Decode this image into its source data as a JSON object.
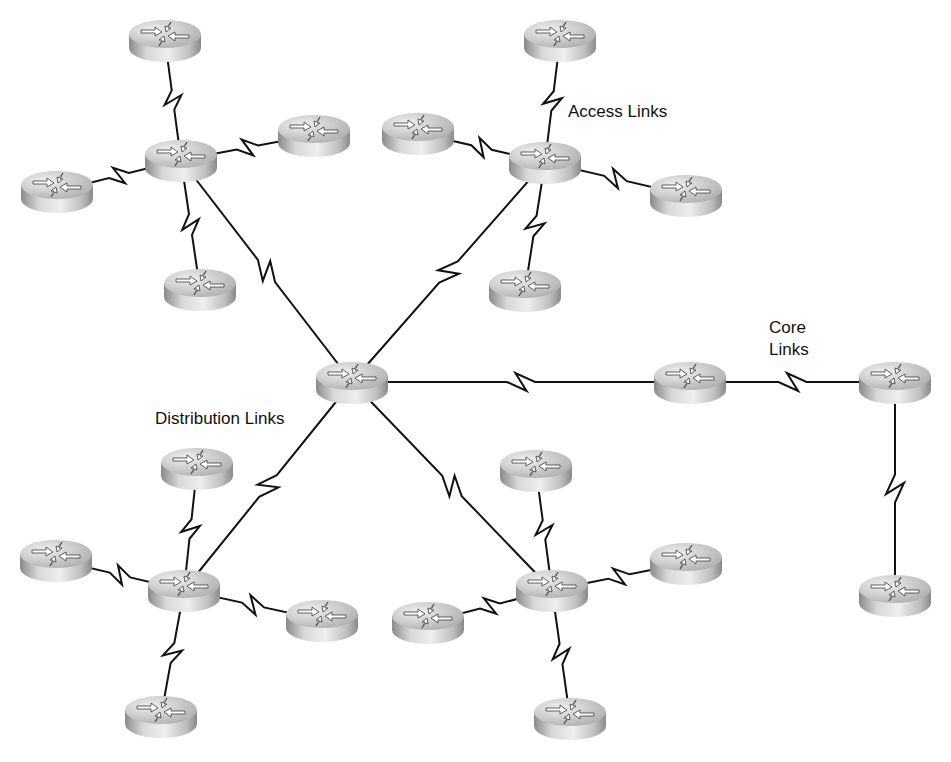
{
  "diagram": {
    "title": "",
    "labels": [
      {
        "id": "access",
        "text": "Access Links",
        "x": 568,
        "y": 117,
        "lines": [
          "Access Links"
        ]
      },
      {
        "id": "core",
        "text": "Core Links",
        "x": 769,
        "y": 333,
        "lines": [
          "Core",
          "Links"
        ]
      },
      {
        "id": "distribution",
        "text": "Distribution Links",
        "x": 155,
        "y": 424,
        "lines": [
          "Distribution Links"
        ]
      }
    ],
    "colors": {
      "link": "#111111",
      "router_top_light": "#e6e6e6",
      "router_top_dark": "#a9a9a9",
      "router_side_light": "#d8d8d8",
      "router_side_dark": "#8a8a8a",
      "arrows": "#ffffff"
    },
    "nodes": [
      {
        "id": "center",
        "type": "router",
        "role": "core",
        "x": 352,
        "y": 382
      },
      {
        "id": "core2",
        "type": "router",
        "role": "core",
        "x": 690,
        "y": 382
      },
      {
        "id": "core3",
        "type": "router",
        "role": "core",
        "x": 895,
        "y": 382
      },
      {
        "id": "core4",
        "type": "router",
        "role": "core",
        "x": 895,
        "y": 595
      },
      {
        "id": "tl_hub",
        "type": "router",
        "role": "distribution",
        "x": 181,
        "y": 160
      },
      {
        "id": "tl_top",
        "type": "router",
        "role": "access",
        "x": 165,
        "y": 40
      },
      {
        "id": "tl_left",
        "type": "router",
        "role": "access",
        "x": 57,
        "y": 191
      },
      {
        "id": "tl_right",
        "type": "router",
        "role": "access",
        "x": 314,
        "y": 135
      },
      {
        "id": "tl_bottom",
        "type": "router",
        "role": "access",
        "x": 200,
        "y": 289
      },
      {
        "id": "tr_hub",
        "type": "router",
        "role": "distribution",
        "x": 545,
        "y": 162
      },
      {
        "id": "tr_top",
        "type": "router",
        "role": "access",
        "x": 560,
        "y": 40
      },
      {
        "id": "tr_left",
        "type": "router",
        "role": "access",
        "x": 418,
        "y": 133
      },
      {
        "id": "tr_right",
        "type": "router",
        "role": "access",
        "x": 686,
        "y": 195
      },
      {
        "id": "tr_bottom",
        "type": "router",
        "role": "access",
        "x": 525,
        "y": 290
      },
      {
        "id": "bl_hub",
        "type": "router",
        "role": "distribution",
        "x": 184,
        "y": 590
      },
      {
        "id": "bl_top",
        "type": "router",
        "role": "access",
        "x": 197,
        "y": 468
      },
      {
        "id": "bl_left",
        "type": "router",
        "role": "access",
        "x": 56,
        "y": 560
      },
      {
        "id": "bl_right",
        "type": "router",
        "role": "access",
        "x": 322,
        "y": 620
      },
      {
        "id": "bl_bottom",
        "type": "router",
        "role": "access",
        "x": 161,
        "y": 716
      },
      {
        "id": "br_hub",
        "type": "router",
        "role": "distribution",
        "x": 552,
        "y": 590
      },
      {
        "id": "br_top",
        "type": "router",
        "role": "access",
        "x": 536,
        "y": 470
      },
      {
        "id": "br_left",
        "type": "router",
        "role": "access",
        "x": 428,
        "y": 622
      },
      {
        "id": "br_right",
        "type": "router",
        "role": "access",
        "x": 686,
        "y": 563
      },
      {
        "id": "br_bottom",
        "type": "router",
        "role": "access",
        "x": 570,
        "y": 718
      }
    ],
    "links": [
      {
        "from": "center",
        "to": "tl_hub",
        "kind": "distribution",
        "serial": true
      },
      {
        "from": "center",
        "to": "tr_hub",
        "kind": "distribution",
        "serial": true
      },
      {
        "from": "center",
        "to": "bl_hub",
        "kind": "distribution",
        "serial": true
      },
      {
        "from": "center",
        "to": "br_hub",
        "kind": "distribution",
        "serial": true
      },
      {
        "from": "center",
        "to": "core2",
        "kind": "core",
        "serial": true
      },
      {
        "from": "core2",
        "to": "core3",
        "kind": "core",
        "serial": true
      },
      {
        "from": "core3",
        "to": "core4",
        "kind": "core",
        "serial": true
      },
      {
        "from": "tl_hub",
        "to": "tl_top",
        "kind": "access",
        "serial": true
      },
      {
        "from": "tl_hub",
        "to": "tl_left",
        "kind": "access",
        "serial": true
      },
      {
        "from": "tl_hub",
        "to": "tl_right",
        "kind": "access",
        "serial": true
      },
      {
        "from": "tl_hub",
        "to": "tl_bottom",
        "kind": "access",
        "serial": true
      },
      {
        "from": "tr_hub",
        "to": "tr_top",
        "kind": "access",
        "serial": true
      },
      {
        "from": "tr_hub",
        "to": "tr_left",
        "kind": "access",
        "serial": true
      },
      {
        "from": "tr_hub",
        "to": "tr_right",
        "kind": "access",
        "serial": true
      },
      {
        "from": "tr_hub",
        "to": "tr_bottom",
        "kind": "access",
        "serial": true
      },
      {
        "from": "bl_hub",
        "to": "bl_top",
        "kind": "access",
        "serial": true
      },
      {
        "from": "bl_hub",
        "to": "bl_left",
        "kind": "access",
        "serial": true
      },
      {
        "from": "bl_hub",
        "to": "bl_right",
        "kind": "access",
        "serial": true
      },
      {
        "from": "bl_hub",
        "to": "bl_bottom",
        "kind": "access",
        "serial": true
      },
      {
        "from": "br_hub",
        "to": "br_top",
        "kind": "access",
        "serial": true
      },
      {
        "from": "br_hub",
        "to": "br_left",
        "kind": "access",
        "serial": true
      },
      {
        "from": "br_hub",
        "to": "br_right",
        "kind": "access",
        "serial": true
      },
      {
        "from": "br_hub",
        "to": "br_bottom",
        "kind": "access",
        "serial": true
      }
    ],
    "icons": {
      "router": "router-icon",
      "serial_link": "lightning-bolt-icon"
    }
  }
}
